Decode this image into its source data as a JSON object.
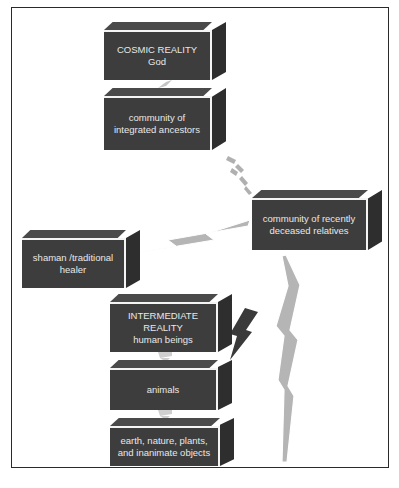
{
  "diagram": {
    "nodes": [
      {
        "id": "cosmic",
        "lines": [
          "COSMIC REALITY",
          "God"
        ]
      },
      {
        "id": "ancestors",
        "lines": [
          "community of",
          "integrated ancestors"
        ]
      },
      {
        "id": "relatives",
        "lines": [
          "community of recently",
          "deceased relatives"
        ]
      },
      {
        "id": "shaman",
        "lines": [
          "shaman /traditional",
          "healer"
        ]
      },
      {
        "id": "intermediate",
        "lines": [
          "INTERMEDIATE REALITY",
          "human beings"
        ]
      },
      {
        "id": "animals",
        "lines": [
          "animals"
        ]
      },
      {
        "id": "earth",
        "lines": [
          "earth, nature, plants,",
          "and inanimate objects"
        ]
      }
    ],
    "connectors": [
      {
        "from": "cosmic",
        "to": "ancestors",
        "style": "dashed-light",
        "color": "#bdbdbd"
      },
      {
        "from": "ancestors",
        "to": "relatives",
        "style": "dashed-bolt",
        "color": "#b0b0b0"
      },
      {
        "from": "relatives",
        "to": "shaman",
        "style": "bolt",
        "color": "#b5b5b5"
      },
      {
        "from": "relatives",
        "to": "earth",
        "style": "long-bolt",
        "color": "#b5b5b5"
      },
      {
        "from": "intermediate",
        "to": "animals",
        "style": "bolt-dark",
        "color": "#3a3a3a"
      },
      {
        "from": "intermediate",
        "to": "animals",
        "style": "dashed-light",
        "color": "#c8c8c8"
      },
      {
        "from": "animals",
        "to": "earth",
        "style": "dashed-light",
        "color": "#c8c8c8"
      }
    ]
  },
  "colors": {
    "box_face": "#3d3d3d",
    "box_top": "#4a4a4a",
    "box_side": "#2e2e2e",
    "box_text": "#e8e8e8",
    "bolt_light": "#b5b5b5",
    "bolt_dark": "#3a3a3a",
    "frame": "#2a2a2a"
  }
}
